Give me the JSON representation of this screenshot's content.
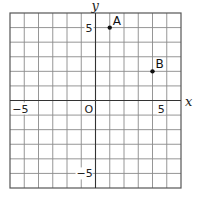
{
  "diagram": {
    "type": "coordinate-plane",
    "x_range": [
      -6,
      6
    ],
    "y_range": [
      -6,
      6
    ],
    "grid_step": 1,
    "axis_labels": {
      "x": "x",
      "y": "y"
    },
    "origin_label": "O",
    "tick_labels": {
      "x_neg": "−5",
      "x_pos": "5",
      "y_pos": "5",
      "y_neg": "−5"
    },
    "points": [
      {
        "name": "A",
        "x": 1,
        "y": 5
      },
      {
        "name": "B",
        "x": 4,
        "y": 2
      }
    ]
  }
}
